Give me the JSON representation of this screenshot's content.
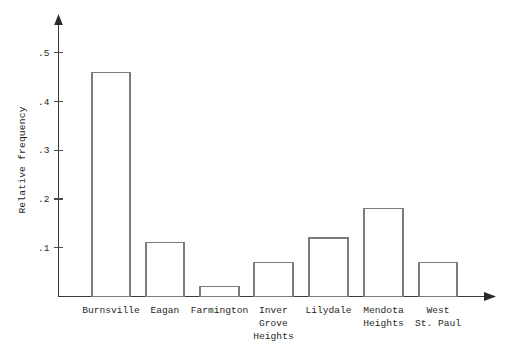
{
  "chart_data": {
    "type": "bar",
    "title": "",
    "subtitle": "",
    "xlabel": "",
    "ylabel": "Relative frequency",
    "categories": [
      "Burnsville",
      "Eagan",
      "Farmington",
      "Inver Grove Heights",
      "Lilydale",
      "Mendota Heights",
      "West St. Paul"
    ],
    "category_label_lines": [
      [
        "Burnsville"
      ],
      [
        "Eagan"
      ],
      [
        "Farmington"
      ],
      [
        "Inver",
        "Grove",
        "Heights"
      ],
      [
        "Lilydale"
      ],
      [
        "Mendota",
        "Heights"
      ],
      [
        "West",
        "St. Paul"
      ]
    ],
    "values": [
      0.46,
      0.11,
      0.02,
      0.07,
      0.12,
      0.18,
      0.07
    ],
    "ylim": [
      0,
      0.53
    ],
    "ytick_values": [
      0.1,
      0.2,
      0.3,
      0.4,
      0.5
    ],
    "ytick_labels": [
      ".1",
      ".2",
      ".3",
      ".4",
      ".5"
    ],
    "grid": false,
    "legend": null,
    "bar_fill_color": "#ffffff",
    "bar_edge_color": "#7c7c7c",
    "axis_color": "#3a3a3a",
    "background_color": "#ffffff",
    "axis_arrows": true
  }
}
